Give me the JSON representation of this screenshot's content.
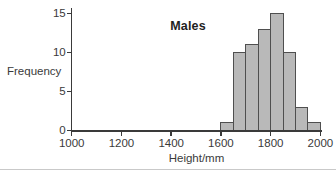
{
  "chart_data": {
    "type": "bar",
    "subtype": "histogram",
    "title": "Males",
    "xlabel": "Height/mm",
    "ylabel": "Frequency",
    "x_ticks": [
      1000,
      1200,
      1400,
      1600,
      1800,
      2000
    ],
    "y_ticks": [
      0,
      5,
      10,
      15
    ],
    "xlim": [
      1000,
      2000
    ],
    "ylim": [
      0,
      15.7
    ],
    "bin_edges": [
      1600,
      1650,
      1700,
      1750,
      1800,
      1850,
      1900,
      1950,
      2000
    ],
    "frequencies": [
      1,
      10,
      11,
      13,
      15,
      10,
      3,
      1
    ],
    "grid": false,
    "legend": false,
    "colors": {
      "bar_fill": "#b9b9b9",
      "bar_border": "#4f4f4f",
      "axis": "#3a3a3a",
      "text": "#3a3a3a",
      "title_text": "#1f1f1f",
      "divider": "#c9c9c9",
      "background": "#ffffff"
    }
  }
}
